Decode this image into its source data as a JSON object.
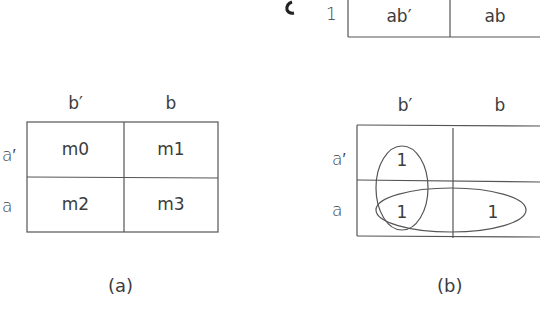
{
  "top_fragment": {
    "row_label": "1",
    "cells": [
      "ab′",
      "ab"
    ]
  },
  "kmap_a": {
    "col_headers": [
      "b′",
      "b"
    ],
    "row_headers": [
      "a′",
      "a"
    ],
    "cells": [
      [
        "m0",
        "m1"
      ],
      [
        "m2",
        "m3"
      ]
    ],
    "caption": "(a)"
  },
  "kmap_b": {
    "col_headers": [
      "b′",
      "b"
    ],
    "row_headers": [
      "a′",
      "a"
    ],
    "cells": [
      [
        "1",
        ""
      ],
      [
        "1",
        "1"
      ]
    ],
    "groups": [
      {
        "name": "vertical-group",
        "cells": [
          "r0c0",
          "r1c0"
        ]
      },
      {
        "name": "horizontal-group",
        "cells": [
          "r1c0",
          "r1c1"
        ]
      }
    ],
    "caption": "(b)"
  },
  "colors": {
    "line": "#555555",
    "text": "#3c3c3c",
    "background": "#ffffff"
  }
}
